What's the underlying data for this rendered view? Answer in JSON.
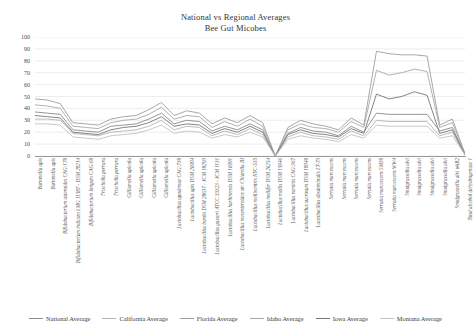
{
  "header": {
    "title_line1": "National vs Regional Averages",
    "title_line2": "Bee Gut Micobes"
  },
  "chart_data": {
    "type": "line",
    "title": "National vs Regional Averages Bee Gut Micobes",
    "xlabel": "",
    "ylabel": "",
    "ylim": [
      0,
      100
    ],
    "yticks": [
      0,
      10,
      20,
      30,
      40,
      50,
      60,
      70,
      80,
      90,
      100
    ],
    "grid": true,
    "legend_position": "bottom",
    "line_color": "#8d8d8d",
    "categories": [
      "Bartonella apis",
      "Bartonella apis",
      "Bifidobacterium asteroides CAG:179",
      "Bifidobacterium indicum LMG 11587 - DSM 20214",
      "Bifidobacterium longum CAG:69",
      "Frischella perrara",
      "Frischella perrara",
      "Gilliamella apicola",
      "Gilliamella apicola",
      "Gilliamella apicola",
      "Gilliamella apicola",
      "Lactobacillus apodemae CAG:739",
      "Lactobacillus apis DSM 26904",
      "Lactobacillus bombi DSM 28637 - JCM 18293",
      "Lactobacillus gasseri ATCC 33323 - JCM 1131",
      "Lactobacillus harbinensis DSM 16991",
      "Lactobacillus mesenteroides str. Chiarella III",
      "Lactobacillus melliventris NYC-535",
      "Lactobacillus mellifer DSM 26254",
      "Lactobacillus mellis DSM 15946",
      "Lactobacillus ruminis CAG:367",
      "Lactobacillus sucrosum DSM 10049",
      "Lactobacillus absdominalis LT-73",
      "Serratia marcescens",
      "Serratia marcescens",
      "Serratia marcescens",
      "Serratia marcescens",
      "Serratia marcescens SM39",
      "Serratia marcescens WW4",
      "Snodgrassella alvi",
      "Snodgrassella alvi",
      "Snodgrassella alvi",
      "Snodgrassella alvi",
      "Snodgrassella alvi wkB2",
      "Total alcohol dehydrogenase 1"
    ],
    "series": [
      {
        "name": "National Average",
        "values": [
          37,
          36,
          35,
          22,
          21,
          20,
          25,
          26,
          27,
          31,
          36,
          27,
          30,
          29,
          21,
          25,
          22,
          27,
          22,
          0,
          19,
          24,
          21,
          20,
          17,
          25,
          20,
          36,
          35,
          35,
          35,
          35,
          21,
          24,
          1
        ]
      },
      {
        "name": "California Average",
        "values": [
          31,
          31,
          30,
          19,
          18,
          17,
          20,
          21,
          22,
          25,
          30,
          22,
          25,
          24,
          17,
          21,
          18,
          23,
          18,
          0,
          16,
          20,
          17,
          16,
          14,
          21,
          17,
          30,
          29,
          29,
          29,
          29,
          17,
          20,
          1
        ]
      },
      {
        "name": "Florida Average",
        "values": [
          48,
          47,
          44,
          28,
          27,
          26,
          31,
          33,
          34,
          39,
          45,
          34,
          38,
          36,
          27,
          32,
          28,
          34,
          28,
          0,
          24,
          30,
          27,
          25,
          22,
          32,
          26,
          88,
          86,
          85,
          85,
          84,
          26,
          31,
          2
        ]
      },
      {
        "name": "Idaho Average",
        "values": [
          43,
          42,
          40,
          25,
          24,
          23,
          28,
          30,
          31,
          35,
          41,
          31,
          34,
          33,
          24,
          29,
          25,
          31,
          25,
          0,
          22,
          27,
          24,
          23,
          20,
          29,
          24,
          72,
          68,
          70,
          73,
          71,
          24,
          28,
          2
        ]
      },
      {
        "name": "Iowa Average",
        "values": [
          34,
          33,
          32,
          20,
          19,
          18,
          22,
          24,
          25,
          28,
          33,
          25,
          27,
          26,
          19,
          23,
          20,
          25,
          20,
          0,
          18,
          22,
          19,
          18,
          16,
          23,
          19,
          52,
          48,
          50,
          54,
          51,
          19,
          22,
          1
        ]
      },
      {
        "name": "Montana Average",
        "values": [
          27,
          27,
          26,
          16,
          15,
          14,
          17,
          18,
          19,
          22,
          26,
          19,
          21,
          20,
          15,
          18,
          16,
          20,
          16,
          0,
          14,
          17,
          15,
          14,
          12,
          18,
          15,
          26,
          25,
          25,
          25,
          25,
          15,
          17,
          1
        ]
      }
    ]
  },
  "legend": {
    "items": [
      {
        "label": "National Average"
      },
      {
        "label": "California Average"
      },
      {
        "label": "Florida Average"
      },
      {
        "label": "Idaho Average"
      },
      {
        "label": "Iowa Average"
      },
      {
        "label": "Montana Average"
      }
    ]
  }
}
